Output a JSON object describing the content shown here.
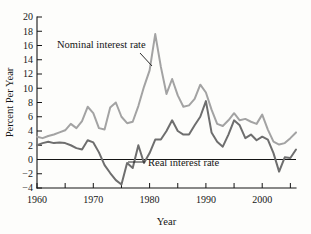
{
  "chart_data": {
    "type": "line",
    "title": "",
    "xlabel": "Year",
    "ylabel": "Percent Per Year",
    "xlim": [
      1960,
      2006
    ],
    "ylim": [
      -4,
      20
    ],
    "grid": false,
    "legend_position": "inline-annotation",
    "x_ticks_major": [
      1960,
      1970,
      1980,
      1990,
      2000
    ],
    "x_ticks_minor": [
      1965,
      1975,
      1985,
      1995,
      2005
    ],
    "y_ticks": [
      -4,
      -2,
      0,
      2,
      4,
      6,
      8,
      10,
      12,
      14,
      16,
      18,
      20
    ],
    "zero_reference_line": 0,
    "annotations": [
      {
        "text": "Nominal interest rate",
        "series": "Nominal interest rate"
      },
      {
        "text": "Real interest rate",
        "series": "Real interest rate"
      }
    ],
    "x": [
      1960,
      1961,
      1962,
      1963,
      1964,
      1965,
      1966,
      1967,
      1968,
      1969,
      1970,
      1971,
      1972,
      1973,
      1974,
      1975,
      1976,
      1977,
      1978,
      1979,
      1980,
      1981,
      1982,
      1983,
      1984,
      1985,
      1986,
      1987,
      1988,
      1989,
      1990,
      1991,
      1992,
      1993,
      1994,
      1995,
      1996,
      1997,
      1998,
      1999,
      2000,
      2001,
      2002,
      2003,
      2004,
      2005,
      2006
    ],
    "series": [
      {
        "name": "Nominal interest rate",
        "color": "#a3a3a3",
        "values": [
          3.2,
          3.0,
          3.3,
          3.5,
          3.8,
          4.1,
          5.0,
          4.4,
          5.4,
          7.4,
          6.5,
          4.4,
          4.2,
          7.3,
          8.0,
          6.0,
          5.1,
          5.3,
          7.5,
          10.2,
          12.5,
          17.6,
          13.0,
          9.2,
          11.3,
          9.0,
          7.4,
          7.6,
          8.5,
          10.5,
          9.4,
          7.0,
          5.0,
          4.7,
          5.5,
          6.5,
          5.5,
          5.7,
          5.3,
          5.0,
          6.3,
          4.2,
          2.5,
          2.1,
          2.3,
          3.0,
          3.8
        ],
        "linewidth": 2.0
      },
      {
        "name": "Real interest rate",
        "color": "#6e6e6e",
        "values": [
          2.0,
          2.3,
          2.5,
          2.3,
          2.4,
          2.3,
          2.0,
          1.6,
          1.4,
          2.7,
          2.4,
          1.0,
          -0.8,
          -1.9,
          -2.9,
          -3.5,
          -0.5,
          -1.2,
          2.0,
          -0.5,
          0.9,
          2.8,
          2.8,
          4.0,
          5.5,
          4.0,
          3.5,
          3.5,
          4.8,
          6.0,
          8.2,
          3.8,
          2.5,
          1.8,
          3.5,
          5.5,
          4.8,
          3.0,
          3.5,
          2.7,
          3.2,
          2.8,
          0.9,
          -1.7,
          0.3,
          0.2,
          1.4
        ],
        "linewidth": 2.0
      }
    ]
  },
  "labels": {
    "y_axis_title": "Percent Per Year",
    "x_axis_title": "Year",
    "nominal": "Nominal interest rate",
    "real": "Real interest rate"
  },
  "y_tick_labels": [
    "20",
    "18",
    "16",
    "14",
    "12",
    "10",
    "8",
    "6",
    "4",
    "2",
    "0",
    "-2",
    "-4"
  ],
  "x_tick_labels": [
    "1960",
    "1970",
    "1980",
    "1990",
    "2000"
  ],
  "colors": {
    "nominal": "#a3a3a3",
    "real": "#6e6e6e",
    "axis": "#141414",
    "background": "#fdfdfb"
  }
}
